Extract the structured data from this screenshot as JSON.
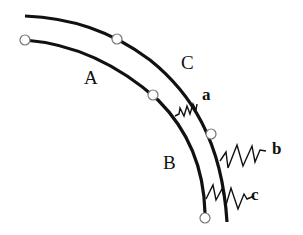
{
  "diagram": {
    "curves": [
      {
        "id": "outer",
        "description": "outer curved beam"
      },
      {
        "id": "inner",
        "description": "inner curved beam"
      }
    ],
    "region_labels": {
      "A": "A",
      "B": "B",
      "C": "C"
    },
    "spring_labels": {
      "a": "a",
      "b": "b",
      "c": "c"
    },
    "nodes": [
      {
        "curve": "inner",
        "x": 25,
        "y": 40
      },
      {
        "curve": "outer",
        "x": 117,
        "y": 39
      },
      {
        "curve": "inner",
        "x": 153,
        "y": 95
      },
      {
        "curve": "outer",
        "x": 211,
        "y": 134
      },
      {
        "curve": "inner",
        "x": 205,
        "y": 218
      }
    ],
    "springs": [
      {
        "label": "a",
        "connects": "inner-outer",
        "type": "zigzag"
      },
      {
        "label": "b",
        "connects": "outer-ground",
        "type": "zigzag"
      },
      {
        "label": "c",
        "connects": "inner-ground",
        "type": "zigzag"
      }
    ],
    "colors": {
      "line": "#111111",
      "node_fill": "#ffffff",
      "node_stroke": "#777777"
    }
  }
}
